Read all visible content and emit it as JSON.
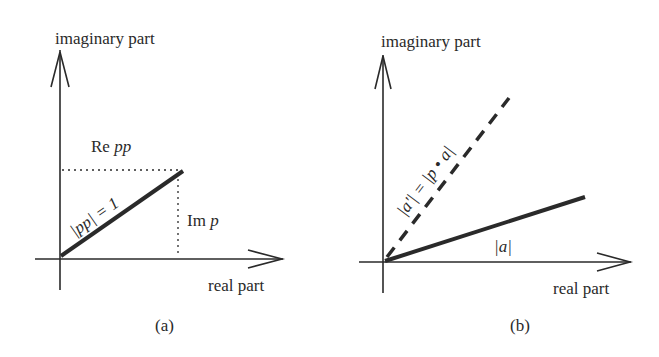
{
  "panel_a": {
    "y_axis_label": "imaginary part",
    "x_axis_label": "real part",
    "re_label_prefix": "Re ",
    "re_label_var": "pp",
    "im_label_prefix": "Im ",
    "im_label_var": "p",
    "vector_label": "|pp| = 1",
    "caption": "(a)"
  },
  "panel_b": {
    "y_axis_label": "imaginary part",
    "x_axis_label": "real part",
    "dashed_label": "|a'| = |p • a|",
    "solid_label": "|a|",
    "caption": "(b)"
  },
  "colors": {
    "ink": "#2a2a2a",
    "background": "#ffffff"
  }
}
